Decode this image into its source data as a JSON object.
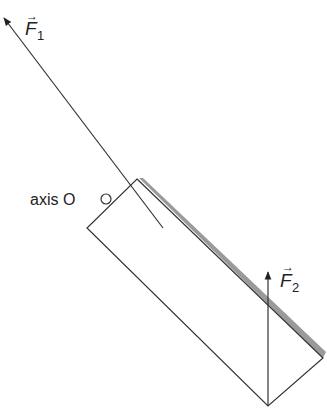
{
  "diagram": {
    "type": "physics-force-diagram",
    "forces": [
      {
        "name": "F1",
        "label": "F",
        "subscript": "1",
        "direction": "up-left, along line through block",
        "vector_arrow": "→"
      },
      {
        "name": "F2",
        "label": "F",
        "subscript": "2",
        "direction": "vertical up from bottom corner",
        "vector_arrow": "→"
      }
    ],
    "axis": {
      "label": "axis O"
    },
    "block": {
      "shape": "tilted rectangle",
      "shadow_edge": "upper-right side (gray)"
    },
    "colors": {
      "stroke": "#333333",
      "shadow": "#9a9a9a",
      "background": "#ffffff"
    }
  }
}
